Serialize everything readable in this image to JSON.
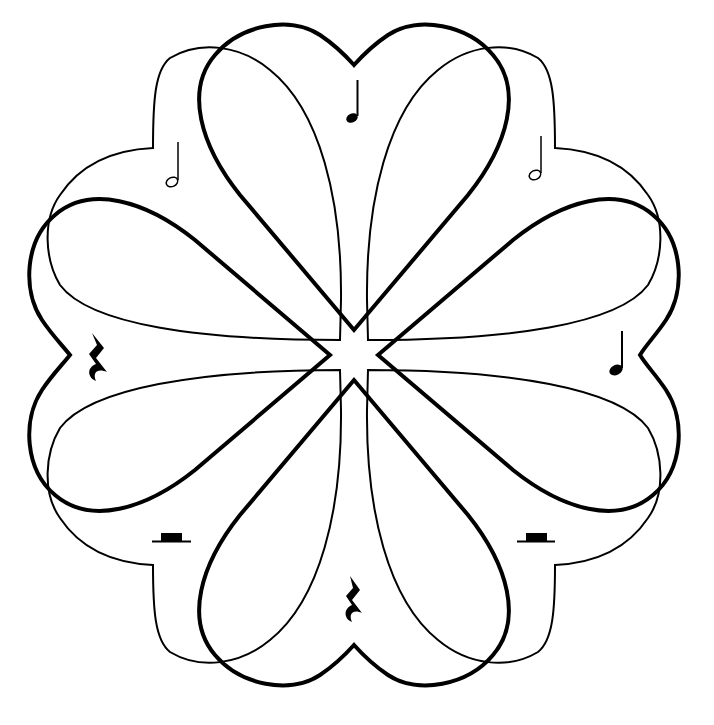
{
  "artwork": {
    "title": "Musical hearts mandala",
    "description": "Line art of eight overlapping hearts arranged radially around a central star, with musical notation symbols placed between the heart lobes",
    "stroke_color": "#000000",
    "background_color": "#ffffff",
    "center": [
      354,
      355
    ],
    "layers": {
      "thick_hearts": {
        "count": 4,
        "rotations_deg": [
          0,
          90,
          180,
          270
        ],
        "stroke_width": 4
      },
      "thin_hearts": {
        "count": 4,
        "rotations_deg": [
          45,
          135,
          225,
          315
        ],
        "stroke_width": 2
      }
    },
    "symbols": [
      {
        "name": "quarter-note",
        "position": "top",
        "x": 352,
        "y": 118
      },
      {
        "name": "half-note",
        "position": "upper-left",
        "x": 174,
        "y": 182
      },
      {
        "name": "half-note",
        "position": "upper-right",
        "x": 536,
        "y": 175
      },
      {
        "name": "quarter-rest",
        "position": "left",
        "x": 97,
        "y": 360
      },
      {
        "name": "quarter-note",
        "position": "right",
        "x": 618,
        "y": 368
      },
      {
        "name": "half-rest",
        "position": "lower-left",
        "x": 172,
        "y": 538
      },
      {
        "name": "half-rest",
        "position": "lower-right",
        "x": 536,
        "y": 538
      },
      {
        "name": "quarter-rest",
        "position": "bottom",
        "x": 354,
        "y": 600
      }
    ]
  }
}
